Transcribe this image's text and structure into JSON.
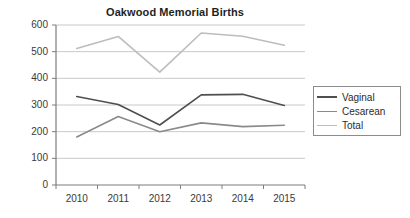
{
  "chart_data": {
    "type": "line",
    "title": "Oakwood Memorial Births",
    "xlabel": "",
    "ylabel": "",
    "categories": [
      "2010",
      "2011",
      "2012",
      "2013",
      "2014",
      "2015"
    ],
    "x": [
      2010,
      2011,
      2012,
      2013,
      2014,
      2015
    ],
    "ylim": [
      0,
      600
    ],
    "yticks": [
      0,
      100,
      200,
      300,
      400,
      500,
      600
    ],
    "grid": "horizontal",
    "legend_position": "right",
    "series": [
      {
        "name": "Vaginal",
        "color": "#4f4f4f",
        "values": [
          332,
          302,
          225,
          338,
          340,
          298
        ]
      },
      {
        "name": "Cesarean",
        "color": "#8a8a8a",
        "values": [
          180,
          257,
          200,
          233,
          219,
          224
        ]
      },
      {
        "name": "Total",
        "color": "#bdbdbd",
        "values": [
          512,
          557,
          423,
          570,
          558,
          524
        ]
      }
    ]
  },
  "axis": {
    "y_tick_labels": [
      "600",
      "500",
      "400",
      "300",
      "200",
      "100",
      "0"
    ],
    "x_tick_labels": [
      "2010",
      "2011",
      "2012",
      "2013",
      "2014",
      "2015"
    ]
  },
  "legend": {
    "entries": [
      {
        "label": "Vaginal"
      },
      {
        "label": "Cesarean"
      },
      {
        "label": "Total"
      }
    ]
  },
  "style": {
    "axis_color": "#7d7d7d",
    "grid_color": "#c9c9c9",
    "text_color": "#3a3a3a",
    "background": "#ffffff"
  }
}
